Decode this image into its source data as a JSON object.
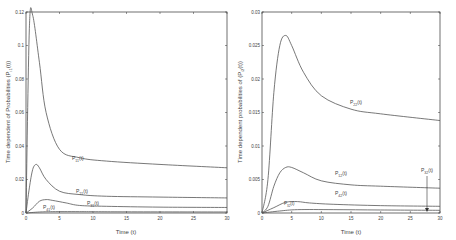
{
  "chart_data": [
    {
      "type": "line",
      "title": "",
      "xlabel": "Time (t)",
      "ylabel": "Time dependent of Probabilities (P_i1(t))",
      "xlim": [
        0,
        30
      ],
      "ylim": [
        0,
        0.12
      ],
      "xticks": [
        "0",
        "5",
        "10",
        "15",
        "20",
        "25",
        "30"
      ],
      "yticks": [
        "0",
        "0.02",
        "0.04",
        "0.06",
        "0.08",
        "0.1",
        "0.12"
      ],
      "grid": false,
      "series": [
        {
          "name": "P_11(t)",
          "x": [
            0,
            0.5,
            1,
            2,
            3,
            5,
            8,
            12,
            20,
            30
          ],
          "values": [
            0,
            0.11,
            0.118,
            0.09,
            0.06,
            0.038,
            0.033,
            0.031,
            0.029,
            0.027
          ]
        },
        {
          "name": "P_21(t)",
          "x": [
            0,
            0.5,
            1,
            1.5,
            2,
            3,
            5,
            8,
            12,
            20,
            30
          ],
          "values": [
            0,
            0.015,
            0.026,
            0.029,
            0.027,
            0.02,
            0.013,
            0.011,
            0.01,
            0.0095,
            0.009
          ]
        },
        {
          "name": "P_31(t)",
          "x": [
            0,
            1,
            2,
            3,
            4,
            6,
            8,
            12,
            20,
            30
          ],
          "values": [
            0,
            0.003,
            0.007,
            0.008,
            0.0075,
            0.006,
            0.0045,
            0.004,
            0.0035,
            0.0033
          ]
        },
        {
          "name": "P_41(t)",
          "x": [
            0,
            2,
            4,
            8,
            15,
            30
          ],
          "values": [
            0,
            0.0006,
            0.0008,
            0.0008,
            0.0007,
            0.0006
          ]
        }
      ],
      "annotations": [
        "P_11(t)",
        "P_21(t)",
        "P_31(t)",
        "P_41(t)"
      ]
    },
    {
      "type": "line",
      "title": "",
      "xlabel": "Time (t)",
      "ylabel": "Time dependent probabilities of (P_i2(t))",
      "xlim": [
        0,
        30
      ],
      "ylim": [
        0,
        0.03
      ],
      "xticks": [
        "0",
        "5",
        "10",
        "15",
        "20",
        "25",
        "30"
      ],
      "yticks": [
        "0",
        "0.005",
        "0.01",
        "0.015",
        "0.02",
        "0.025",
        "0.03"
      ],
      "grid": false,
      "series": [
        {
          "name": "P_22(t)",
          "x": [
            0,
            1,
            2,
            3,
            4,
            5,
            7,
            10,
            15,
            20,
            30
          ],
          "values": [
            0,
            0.005,
            0.018,
            0.025,
            0.0265,
            0.025,
            0.021,
            0.0175,
            0.0155,
            0.0148,
            0.0138
          ]
        },
        {
          "name": "P_12(t)",
          "x": [
            0,
            1,
            2,
            3,
            4,
            5,
            7,
            10,
            15,
            20,
            30
          ],
          "values": [
            0,
            0.001,
            0.004,
            0.006,
            0.0068,
            0.0068,
            0.006,
            0.0048,
            0.0042,
            0.004,
            0.0037
          ]
        },
        {
          "name": "P_42(t)",
          "x": [
            0,
            2,
            4,
            6,
            8,
            12,
            20,
            30
          ],
          "values": [
            0,
            0.0008,
            0.0016,
            0.0017,
            0.0015,
            0.0013,
            0.0011,
            0.001
          ]
        },
        {
          "name": "P_32(t)",
          "x": [
            0,
            3,
            6,
            12,
            20,
            30
          ],
          "values": [
            0,
            0.0003,
            0.0005,
            0.0005,
            0.00045,
            0.0004
          ]
        }
      ],
      "annotations": [
        "P_22(t)",
        "P_12(t)",
        "P_42(t)",
        "P_32(t)",
        "P_32(t) arrow at t≈28"
      ]
    }
  ],
  "left": {
    "ylabel": "Time dependent of Probabilities (P",
    "ylabel_sub": "i1",
    "ylabel_end": "(t))",
    "xlabel": "Time (t)",
    "labels": {
      "p11": "P",
      "p11_sub": "11",
      "p11_end": "(t)",
      "p21": "P",
      "p21_sub": "21",
      "p21_end": "(t)",
      "p31": "P",
      "p31_sub": "31",
      "p31_end": "(t)",
      "p41": "P",
      "p41_sub": "41",
      "p41_end": "(t)"
    }
  },
  "right": {
    "ylabel": "Time dependent probabilities of (P",
    "ylabel_sub": "i2",
    "ylabel_end": "(t))",
    "xlabel": "Time (t)",
    "labels": {
      "p22": "P",
      "p22_sub": "22",
      "p22_end": "(t)",
      "p12": "P",
      "p12_sub": "12",
      "p12_end": "(t)",
      "p42": "P",
      "p42_sub": "42",
      "p42_end": "(t)",
      "p32": "P",
      "p32_sub": "32",
      "p32_end": "(t)"
    }
  },
  "colors": {
    "line": "#555555",
    "axis": "#333333",
    "text": "#444444"
  }
}
